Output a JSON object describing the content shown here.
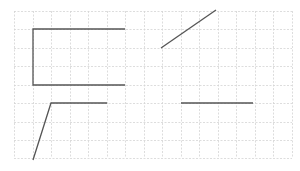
{
  "diagram": {
    "type": "grid-line-drawing",
    "colors": {
      "grid": "#d4d4d4",
      "stroke": "#555555",
      "background": "#ffffff"
    },
    "grid": {
      "x": [
        14,
        33,
        51,
        70,
        88,
        107,
        125,
        144,
        162,
        181,
        199,
        218,
        236,
        255,
        273,
        292
      ],
      "y": [
        11,
        29,
        48,
        66,
        85,
        103,
        122,
        140,
        158
      ],
      "spacing": 18.5
    },
    "shapes": [
      {
        "name": "open-rectangle",
        "points": [
          [
            125,
            29
          ],
          [
            33,
            29
          ],
          [
            33,
            85
          ],
          [
            125,
            85
          ]
        ]
      },
      {
        "name": "diagonal-segment",
        "points": [
          [
            161,
            48
          ],
          [
            216,
            10
          ]
        ]
      },
      {
        "name": "bent-segment",
        "points": [
          [
            33,
            160
          ],
          [
            51,
            103
          ],
          [
            107,
            103
          ]
        ]
      },
      {
        "name": "horizontal-segment",
        "points": [
          [
            181,
            103
          ],
          [
            253,
            103
          ]
        ]
      }
    ]
  }
}
